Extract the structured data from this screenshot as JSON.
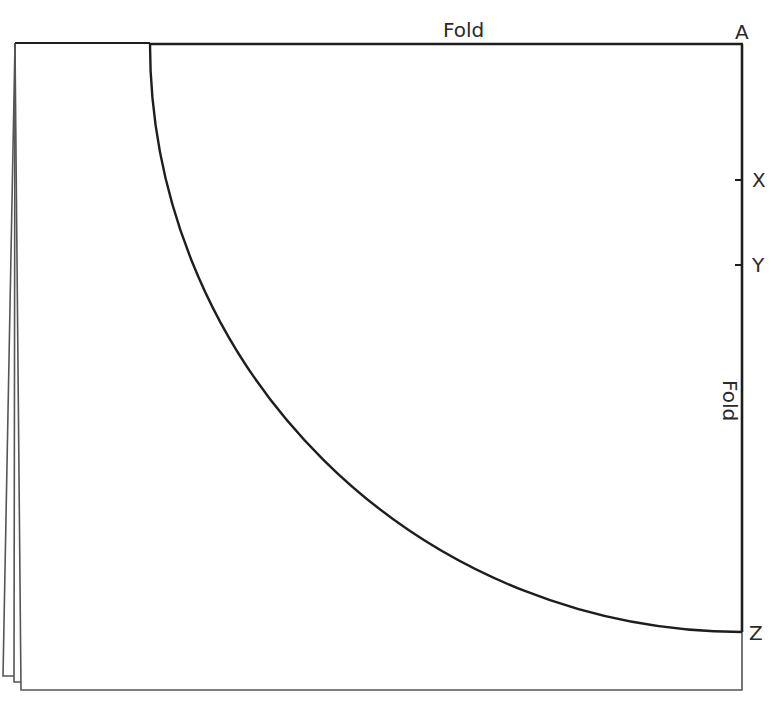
{
  "diagram": {
    "labels": {
      "top_fold": "Fold",
      "right_fold": "Fold",
      "corner_a": "A",
      "point_x": "X",
      "point_y": "Y",
      "point_z": "Z"
    },
    "colors": {
      "line": "#1e1e1e",
      "thin_line": "#555555",
      "text": "#2a2a2a",
      "background": "#ffffff"
    },
    "geometry": {
      "sheet": {
        "top": 43,
        "right": 742,
        "bottom": 690,
        "left_top": 15,
        "left_bottom": 21
      },
      "layers_bottom_left": [
        {
          "x": 3,
          "y": 676
        },
        {
          "x": 14,
          "y": 682
        },
        {
          "x": 21,
          "y": 690
        }
      ],
      "arc": {
        "start": {
          "x": 150,
          "y": 43
        },
        "end": {
          "x": 742,
          "y": 632
        },
        "center": "A"
      },
      "ticks": [
        {
          "label": "X",
          "y": 180
        },
        {
          "label": "Y",
          "y": 265
        },
        {
          "label": "Z",
          "y": 632
        }
      ]
    }
  }
}
